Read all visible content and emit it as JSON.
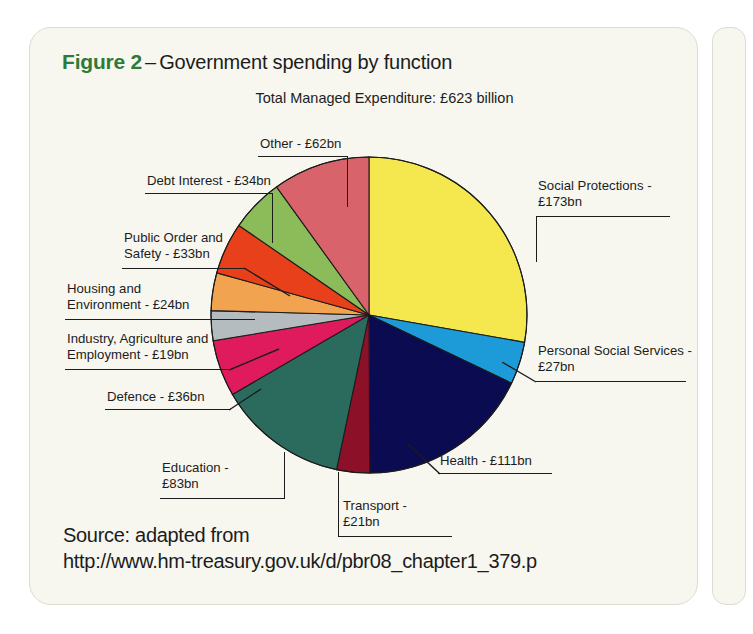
{
  "figure": {
    "number": "Figure 2",
    "dash": "–",
    "title": "Government spending by function",
    "subtitle": "Total Managed Expenditure: £623 billion"
  },
  "source": {
    "line1": "Source: adapted from",
    "line2": "http://www.hm-treasury.gov.uk/d/pbr08_chapter1_379.p"
  },
  "colors": {
    "figure_number": "#2F7A37",
    "card_background": "#F7F7F0",
    "text": "#1c1c1c",
    "leader_line": "#1c1c1c"
  },
  "chart_data": {
    "type": "pie",
    "title": "Government spending by function",
    "subtitle": "Total Managed Expenditure: £623 billion",
    "unit": "£bn",
    "total": 623,
    "start_angle_deg": 0,
    "direction": "clockwise",
    "legend": "callout-labels",
    "grid": false,
    "categories": [
      "Social Protections",
      "Personal Social Services",
      "Health",
      "Transport",
      "Education",
      "Defence",
      "Industry, Agriculture and Employment",
      "Housing and Environment",
      "Public Order and Safety",
      "Debt Interest",
      "Other"
    ],
    "values": [
      173,
      27,
      111,
      21,
      83,
      36,
      19,
      24,
      33,
      34,
      62
    ],
    "colors": [
      "#F5E84F",
      "#1C9BD8",
      "#0B0B52",
      "#8B1028",
      "#2B6B5E",
      "#E01B5D",
      "#B5BCC0",
      "#F2A34F",
      "#E8401A",
      "#8CBB5A",
      "#D9636B"
    ],
    "slices": [
      {
        "label": "Social Protections",
        "value": 173,
        "label_text": "Social Protections -\n£173bn",
        "color": "#F5E84F"
      },
      {
        "label": "Personal Social Services",
        "value": 27,
        "label_text": "Personal Social Services -\n£27bn",
        "color": "#1C9BD8"
      },
      {
        "label": "Health",
        "value": 111,
        "label_text": "Health - £111bn",
        "color": "#0B0B52"
      },
      {
        "label": "Transport",
        "value": 21,
        "label_text": "Transport -\n£21bn",
        "color": "#8B1028"
      },
      {
        "label": "Education",
        "value": 83,
        "label_text": "Education -\n£83bn",
        "color": "#2B6B5E"
      },
      {
        "label": "Defence",
        "value": 36,
        "label_text": "Defence - £36bn",
        "color": "#E01B5D"
      },
      {
        "label": "Industry, Agriculture and Employment",
        "value": 19,
        "label_text": "Industry, Agriculture and\nEmployment - £19bn",
        "color": "#B5BCC0"
      },
      {
        "label": "Housing and Environment",
        "value": 24,
        "label_text": "Housing and\nEnvironment - £24bn",
        "color": "#F2A34F"
      },
      {
        "label": "Public Order and Safety",
        "value": 33,
        "label_text": "Public Order and\nSafety - £33bn",
        "color": "#E8401A"
      },
      {
        "label": "Debt Interest",
        "value": 34,
        "label_text": "Debt Interest - £34bn",
        "color": "#8CBB5A"
      },
      {
        "label": "Other",
        "value": 62,
        "label_text": "Other - £62bn",
        "color": "#D9636B"
      }
    ]
  }
}
